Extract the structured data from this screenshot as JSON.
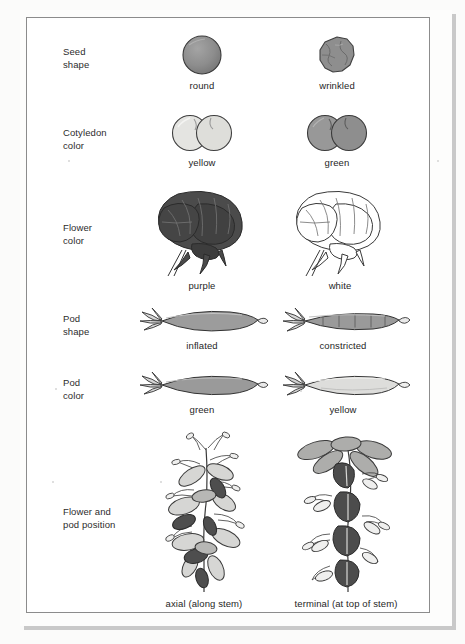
{
  "figure": {
    "rows": [
      {
        "id": "seed-shape",
        "label": "Seed\nshape",
        "left": {
          "caption": "round",
          "art": "round-seed"
        },
        "right": {
          "caption": "wrinkled",
          "art": "wrinkled-seed"
        }
      },
      {
        "id": "cotyledon-color",
        "label": "Cotyledon\ncolor",
        "left": {
          "caption": "yellow",
          "art": "yellow-cotyledons"
        },
        "right": {
          "caption": "green",
          "art": "green-cotyledons"
        }
      },
      {
        "id": "flower-color",
        "label": "Flower\ncolor",
        "left": {
          "caption": "purple",
          "art": "purple-flower"
        },
        "right": {
          "caption": "white",
          "art": "white-flower"
        }
      },
      {
        "id": "pod-shape",
        "label": "Pod\nshape",
        "left": {
          "caption": "inflated",
          "art": "inflated-pod"
        },
        "right": {
          "caption": "constricted",
          "art": "constricted-pod"
        }
      },
      {
        "id": "pod-color",
        "label": "Pod\ncolor",
        "left": {
          "caption": "green",
          "art": "green-pod"
        },
        "right": {
          "caption": "yellow",
          "art": "yellow-pod"
        }
      },
      {
        "id": "flower-and-pod-position",
        "label": "Flower and\npod position",
        "left": {
          "caption": "axial (along stem)",
          "art": "axial-stem"
        },
        "right": {
          "caption": "terminal (at top of stem)",
          "art": "terminal-stem"
        }
      }
    ]
  },
  "colors": {
    "seed_gray": "#8d8d8d",
    "seed_outline": "#3a3a3a",
    "yellow_pale": "#e2e2e0",
    "green_mid": "#9a9a9a",
    "purple_dark": "#4a4a4a",
    "white_fill": "#ffffff",
    "pod_green": "#9e9e9e",
    "pod_yellow": "#dedede",
    "frame_line": "#8c8c8c",
    "text": "#262626",
    "paper": "#ffffff"
  }
}
